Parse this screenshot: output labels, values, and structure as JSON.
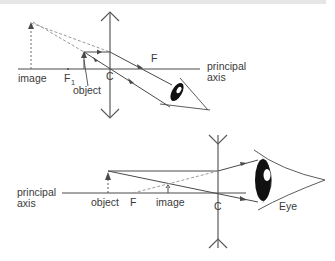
{
  "figure": {
    "top_diagram": {
      "title": "Convex lens used as a magnifying glass",
      "labels": {
        "image": "image",
        "f1": "F",
        "f1_sub": "1",
        "object": "object",
        "center": "C",
        "focus": "F",
        "axis_line1": "principal",
        "axis_line2": "axis"
      }
    },
    "bottom_diagram": {
      "title": "Concave lens forming a virtual image",
      "labels": {
        "axis_line1": "principal",
        "axis_line2": "axis",
        "object": "object",
        "focus": "F",
        "image": "image",
        "center": "C",
        "eye": "Eye"
      }
    },
    "colors": {
      "line": "#4a4a4a",
      "dashed": "#8a8a8a",
      "eye_dark": "#111111",
      "eye_gray": "#6e6e6e"
    }
  }
}
